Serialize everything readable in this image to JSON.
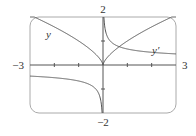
{
  "chart_data": {
    "type": "line",
    "title": "",
    "xlabel": "",
    "ylabel": "",
    "xlim": [
      -3,
      3
    ],
    "ylim": [
      -2,
      2
    ],
    "grid": false,
    "legend": "inline labels",
    "tick_labels": {
      "x_min": "−3",
      "x_max": "3",
      "y_max": "2",
      "y_min": "−2"
    },
    "x_ticks": [
      -3,
      -2,
      -1,
      0,
      1,
      2,
      3
    ],
    "y_ticks": [
      -2,
      -1,
      0,
      1,
      2
    ],
    "series": [
      {
        "name": "y",
        "label": "y",
        "formula": "x^(2/3)",
        "x": [
          -3,
          -2.5,
          -2,
          -1.5,
          -1,
          -0.5,
          -0.1,
          0,
          0.1,
          0.5,
          1,
          1.5,
          2,
          2.5,
          3
        ],
        "values": [
          2.08,
          1.84,
          1.59,
          1.31,
          1.0,
          0.63,
          0.22,
          0,
          0.22,
          0.63,
          1.0,
          1.31,
          1.59,
          1.84,
          2.08
        ]
      },
      {
        "name": "y'",
        "label": "y′",
        "formula": "(2/3)x^(-1/3)",
        "x": [
          -3,
          -2,
          -1,
          -0.5,
          -0.1,
          -0.04,
          0.04,
          0.1,
          0.5,
          1,
          2,
          3
        ],
        "values": [
          -0.46,
          -0.53,
          -0.67,
          -0.84,
          -1.44,
          -1.95,
          1.95,
          1.44,
          0.84,
          0.67,
          0.53,
          0.46
        ]
      }
    ]
  },
  "colors": {
    "frame": "#9a9a9a",
    "axis": "#555555",
    "curve": "#555555",
    "text": "#333333"
  }
}
